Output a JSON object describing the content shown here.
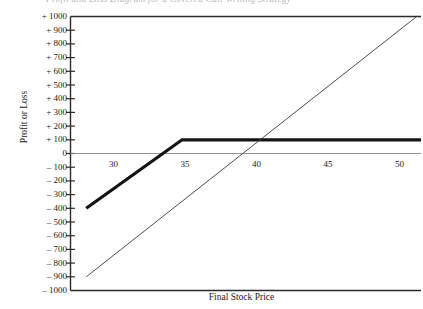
{
  "top_caption": "Profit and Loss Diagram for a Covered Call Writing Strategy",
  "chart_data": {
    "type": "line",
    "title": "",
    "xlabel": "Final Stock Price",
    "ylabel": "Profit or Loss",
    "xlim": [
      27.0,
      51.5
    ],
    "ylim": [
      -1000,
      1000
    ],
    "grid": false,
    "legend": "none",
    "xticks": [
      30,
      35,
      40,
      45,
      50
    ],
    "xticklabels": [
      "30",
      "35",
      "40",
      "45",
      "50"
    ],
    "yticks": [
      1000,
      900,
      800,
      700,
      600,
      500,
      400,
      300,
      200,
      100,
      0,
      -100,
      -200,
      -300,
      -400,
      -500,
      -600,
      -700,
      -800,
      -900,
      -1000
    ],
    "yticklabels": [
      "+ 1000",
      "+ 900",
      "+ 800",
      "+ 700",
      "+ 600",
      "+ 500",
      "+ 400",
      "+ 300",
      "+ 200",
      "+ 100",
      "0",
      "– 100",
      "– 200",
      "– 300",
      "– 400",
      "– 500",
      "– 600",
      "– 700",
      "– 800",
      "– 900",
      "– 1000"
    ],
    "zero_line": 0,
    "series": [
      {
        "name": "Covered Call Payoff",
        "style": "thick",
        "color": "#141414",
        "width": 3.2,
        "x": [
          28.1,
          34.8,
          51.5
        ],
        "y": [
          -400,
          100,
          100
        ]
      },
      {
        "name": "Long Stock Payoff",
        "style": "thin",
        "color": "#3a3a3a",
        "width": 0.9,
        "x": [
          28.1,
          51.2
        ],
        "y": [
          -900,
          1000
        ]
      }
    ],
    "annotations": []
  },
  "axes": {
    "frame_color": "#2b2b2b",
    "zero_line_color": "#8a8a8a",
    "tick_color": "#2b2b2b"
  }
}
